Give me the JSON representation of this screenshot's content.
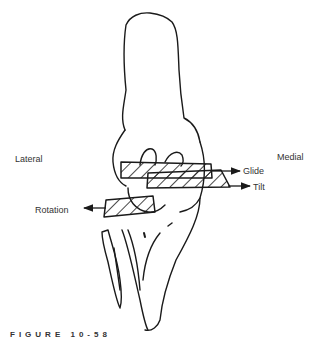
{
  "figure": {
    "caption": "FIGURE 10-58",
    "labels": {
      "lateral": "Lateral",
      "medial": "Medial",
      "glide": "Glide",
      "tilt": "Tilt",
      "rotation": "Rotation"
    },
    "stroke_color": "#1a1a1a",
    "hatch_color": "#1a1a1a"
  }
}
